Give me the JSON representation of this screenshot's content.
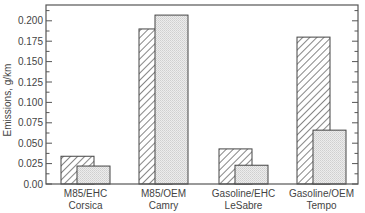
{
  "chart_data": {
    "type": "bar",
    "title": "",
    "xlabel": "",
    "ylabel": "Emissions, g/km",
    "ylim": [
      0,
      0.22
    ],
    "yticks": [
      0.0,
      0.025,
      0.05,
      0.075,
      0.1,
      0.125,
      0.15,
      0.175,
      0.2
    ],
    "ytick_labels": [
      "0.00",
      "0.025",
      "0.050",
      "0.075",
      "0.100",
      "0.125",
      "0.150",
      "0.175",
      "0.200"
    ],
    "grid": false,
    "legend": null,
    "categories": [
      {
        "line1": "M85/EHC",
        "line2": "Corsica"
      },
      {
        "line1": "M85/OEM",
        "line2": "Camry"
      },
      {
        "line1": "Gasoline/EHC",
        "line2": "LeSabre"
      },
      {
        "line1": "Gasoline/OEM",
        "line2": "Tempo"
      }
    ],
    "series": [
      {
        "name": "hatched",
        "pattern": "diagonal-hatch",
        "values": [
          0.034,
          0.19,
          0.043,
          0.18
        ]
      },
      {
        "name": "stippled",
        "pattern": "gray-stipple",
        "values": [
          0.022,
          0.207,
          0.023,
          0.066
        ]
      }
    ]
  },
  "colors": {
    "axis": "#555555",
    "hatch_line": "#444444",
    "stipple_fill": "#e2e2e2",
    "text": "#444444"
  }
}
